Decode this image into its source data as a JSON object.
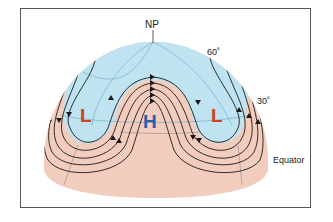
{
  "labels": {
    "north_pole": "NP",
    "lat_60": "60˚",
    "lat_30": "30˚",
    "equator": "Equator",
    "low_left": "L",
    "high_center": "H",
    "low_right": "L"
  },
  "colors": {
    "polar_air": "#bfe3f0",
    "warm_air": "#f2cdbd",
    "low_pressure": "#d2401c",
    "high_pressure": "#2b5ea8",
    "flow_lines": "#1a1a1a",
    "grid_lines": "#6aa7c2"
  }
}
